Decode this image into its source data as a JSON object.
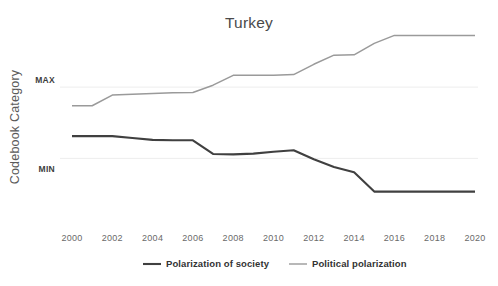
{
  "chart_data": {
    "type": "line",
    "title": "Turkey",
    "xlabel": "",
    "ylabel": "Codebook Category",
    "x": [
      2000,
      2001,
      2002,
      2003,
      2004,
      2005,
      2006,
      2007,
      2008,
      2009,
      2010,
      2011,
      2012,
      2013,
      2014,
      2015,
      2016,
      2017,
      2018,
      2019,
      2020
    ],
    "xlim": [
      2000,
      2020
    ],
    "xticks": [
      2000,
      2002,
      2004,
      2006,
      2008,
      2010,
      2012,
      2014,
      2016,
      2018,
      2020
    ],
    "xticklabels": [
      "2000",
      "2002",
      "2004",
      "2006",
      "2008",
      "2010",
      "2012",
      "2014",
      "2016",
      "2018",
      "2020"
    ],
    "ylim": [
      0,
      10
    ],
    "yticks": [
      3.35,
      7.1
    ],
    "yticklabels": [
      "MIN",
      "MAX"
    ],
    "grid": true,
    "grid_axis": "y",
    "legend_position": "bottom",
    "series": [
      {
        "name": "Polarization of society",
        "color": "#404040",
        "width": 2.1,
        "values": [
          4.52,
          4.52,
          4.52,
          4.42,
          4.32,
          4.3,
          4.3,
          3.58,
          3.56,
          3.6,
          3.7,
          3.78,
          3.3,
          2.9,
          2.62,
          1.6,
          1.6,
          1.6,
          1.6,
          1.6,
          1.6
        ]
      },
      {
        "name": "Political polarization",
        "color": "#9a9a9a",
        "width": 1.5,
        "values": [
          6.12,
          6.12,
          6.68,
          6.72,
          6.76,
          6.8,
          6.82,
          7.2,
          7.72,
          7.72,
          7.72,
          7.76,
          8.3,
          8.78,
          8.8,
          9.4,
          9.82,
          9.82,
          9.82,
          9.82,
          9.82
        ]
      }
    ]
  },
  "layout": {
    "plot_left": 60,
    "plot_right": 478,
    "plot_top": 32,
    "plot_bottom": 222,
    "x_first_px": 72,
    "x_last_px": 475,
    "title_x": 249,
    "title_y": 28,
    "ylabel_x": 19,
    "ylabel_y": 127,
    "xtick_y": 241,
    "legend_y": 267,
    "legend_items": [
      {
        "marker_x1": 143,
        "marker_x2": 161,
        "text_x": 166
      },
      {
        "marker_x1": 289,
        "marker_x2": 307,
        "text_x": 312
      }
    ]
  },
  "colors": {
    "background": "#ffffff",
    "grid": "#ededed",
    "title_text": "#4a4a4a",
    "axis_text": "#6a6a6a",
    "series_dark": "#404040",
    "series_light": "#9a9a9a"
  }
}
